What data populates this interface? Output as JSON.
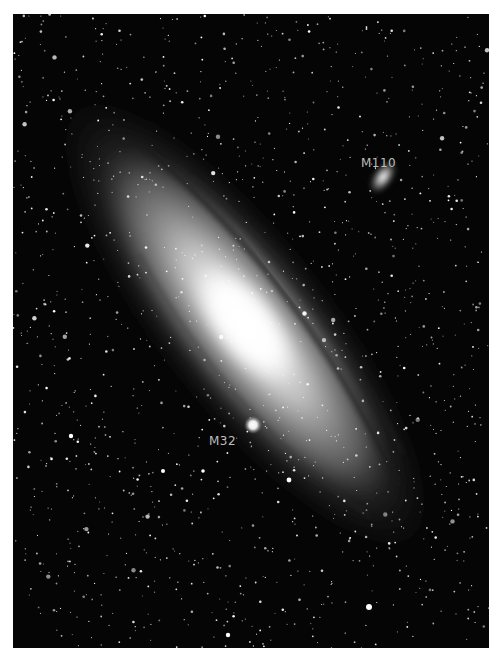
{
  "image": {
    "subject": "Andromeda Galaxy with satellite galaxies",
    "background_color": "#050505",
    "frame_color": "#ffffff"
  },
  "labels": [
    {
      "id": "m110",
      "text": "M110",
      "x": 361,
      "y": 150
    },
    {
      "id": "m32",
      "text": "M32",
      "x": 209,
      "y": 427
    }
  ],
  "objects": {
    "main_galaxy": {
      "cx": 245,
      "cy": 320,
      "core_color": "#ffffff"
    },
    "m110": {
      "cx": 383,
      "cy": 177
    },
    "m32": {
      "cx": 253,
      "cy": 425
    }
  }
}
